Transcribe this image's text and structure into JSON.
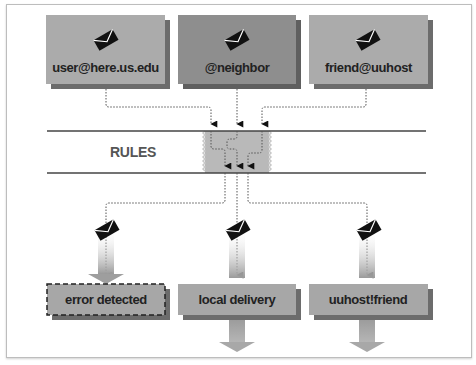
{
  "colors": {
    "box_fill": "#a9a9a9",
    "box_fill_dark": "#8f8f8f",
    "box_shadow": "#6e6e6e",
    "rules_zone": "#b8b8b8",
    "line": "#444444",
    "envelope": "#111111",
    "arrow_fill": "#a0a0a0"
  },
  "sources": [
    {
      "label": "user@here.us.edu",
      "icon": "envelope-icon"
    },
    {
      "label": "@neighbor",
      "icon": "envelope-icon"
    },
    {
      "label": "friend@uuhost",
      "icon": "envelope-icon"
    }
  ],
  "rules": {
    "label": "RULES"
  },
  "destinations": [
    {
      "label": "error detected",
      "style": "dashed",
      "icon": "envelope-icon"
    },
    {
      "label": "local delivery",
      "style": "solid",
      "icon": "envelope-icon"
    },
    {
      "label": "uuhost!friend",
      "style": "solid",
      "icon": "envelope-icon"
    }
  ]
}
